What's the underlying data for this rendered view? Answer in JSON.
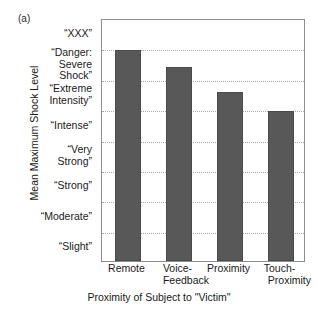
{
  "panel": {
    "letter": "(a)"
  },
  "chart_data": {
    "type": "bar",
    "title": "",
    "xlabel": "Proximity of Subject to \"Victim\"",
    "ylabel": "Mean Maximum Shock Level",
    "categories": [
      "Remote",
      "Voice-Feedback",
      "Proximity",
      "Touch-Proximity"
    ],
    "category_lines": [
      [
        "Remote"
      ],
      [
        "Voice-",
        "Feedback"
      ],
      [
        "Proximity"
      ],
      [
        "Touch-",
        "Proximity"
      ]
    ],
    "values": [
      7.45,
      6.9,
      6.05,
      5.45
    ],
    "ylim": [
      1,
      8
    ],
    "ytick_values": [
      1,
      2,
      3,
      4,
      5,
      6,
      7,
      8
    ],
    "ytick_labels": [
      "“Slight”",
      "“Moderate”",
      "“Strong”",
      "“Very\nStrong”",
      "“Intense”",
      "“Extreme\nIntensity”",
      "“Danger:\nSevere\nShock”",
      "“XXX”"
    ],
    "grid": true,
    "grid_axis": "y",
    "legend": "none",
    "bar_color": "#585858",
    "grid_color": "#a8a8a8",
    "frame_color": "#8d8d8d"
  }
}
